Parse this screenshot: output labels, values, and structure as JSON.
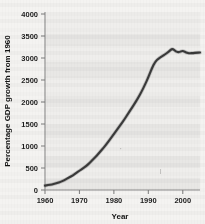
{
  "figure": {
    "kind": "scanned-line-chart",
    "line_color": "#3a3a3a",
    "background_color": "#f1f0ee",
    "axis_color": "#8d8d8d",
    "text_color": "#1d1d1d"
  },
  "axes": {
    "y_title": "Percentage GDP growth from 1960",
    "x_title": "Year",
    "y_ticks": [
      "0",
      "500",
      "1000",
      "1500",
      "2000",
      "2500",
      "3000",
      "3500",
      "4000"
    ],
    "x_ticks": [
      "1960",
      "1970",
      "1980",
      "1990",
      "2000"
    ]
  },
  "chart_data": {
    "type": "line",
    "title": "",
    "subtitle": "",
    "xlabel": "Year",
    "ylabel": "Percentage GDP growth from 1960",
    "xlim": [
      1960,
      2005
    ],
    "ylim": [
      0,
      4000
    ],
    "xticks": [
      1960,
      1970,
      1980,
      1990,
      2000
    ],
    "yticks": [
      0,
      500,
      1000,
      1500,
      2000,
      2500,
      3000,
      3500,
      4000
    ],
    "grid": false,
    "legend": null,
    "series": [
      {
        "name": "Percentage GDP growth from 1960",
        "color": "#3a3a3a",
        "x": [
          1960,
          1961,
          1962,
          1963,
          1964,
          1965,
          1966,
          1967,
          1968,
          1969,
          1970,
          1971,
          1972,
          1973,
          1974,
          1975,
          1976,
          1977,
          1978,
          1979,
          1980,
          1981,
          1982,
          1983,
          1984,
          1985,
          1986,
          1987,
          1988,
          1989,
          1990,
          1991,
          1992,
          1993,
          1994,
          1995,
          1996,
          1997,
          1998,
          1999,
          2000,
          2001,
          2002,
          2003,
          2004,
          2005
        ],
        "y": [
          100,
          110,
          125,
          145,
          170,
          200,
          240,
          285,
          330,
          385,
          440,
          490,
          545,
          620,
          700,
          780,
          870,
          960,
          1060,
          1165,
          1270,
          1380,
          1490,
          1600,
          1720,
          1840,
          1960,
          2090,
          2230,
          2390,
          2560,
          2760,
          2920,
          2990,
          3040,
          3090,
          3150,
          3220,
          3140,
          3130,
          3170,
          3120,
          3105,
          3115,
          3120,
          3125
        ]
      }
    ],
    "annotations": []
  }
}
